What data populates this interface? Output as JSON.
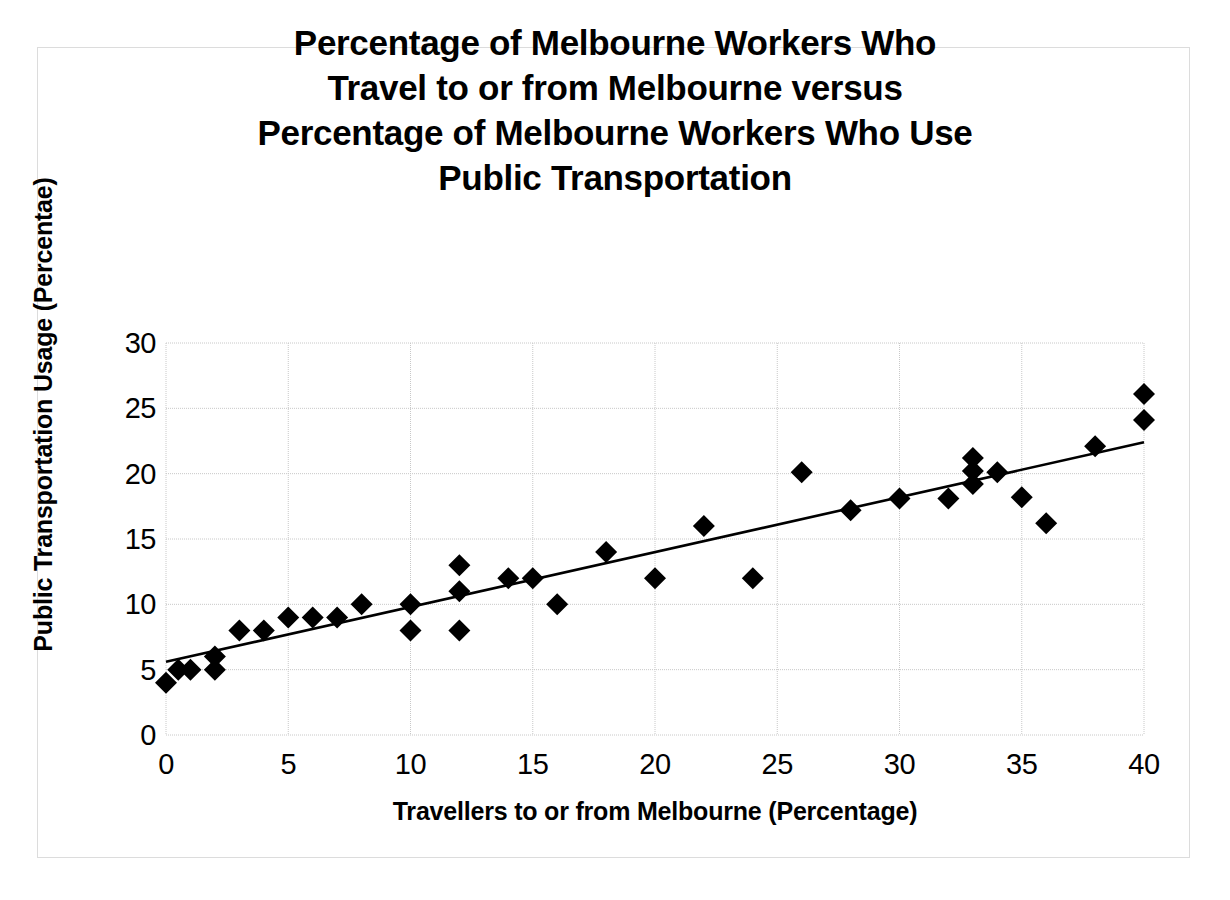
{
  "chart_data": {
    "type": "scatter",
    "title": "Percentage of Melbourne Workers Who\nTravel to or from Melbourne versus\nPercentage of Melbourne Workers Who Use\nPublic Transportation",
    "xlabel": "Travellers to or from Melbourne (Percentage)",
    "ylabel": "Public Transportation Usage (Percentae)",
    "xlim": [
      0,
      40
    ],
    "ylim": [
      0,
      30
    ],
    "xticks": [
      0,
      5,
      10,
      15,
      20,
      25,
      30,
      35,
      40
    ],
    "yticks": [
      0,
      5,
      10,
      15,
      20,
      25,
      30
    ],
    "grid": true,
    "legend": "none",
    "marker": "diamond",
    "marker_color": "#000000",
    "series": [
      {
        "name": "Melbourne workers",
        "points": [
          [
            0,
            4
          ],
          [
            0.5,
            5
          ],
          [
            1,
            5
          ],
          [
            2,
            6
          ],
          [
            2,
            5
          ],
          [
            3,
            8
          ],
          [
            4,
            8
          ],
          [
            5,
            9
          ],
          [
            6,
            9
          ],
          [
            7,
            9
          ],
          [
            8,
            10
          ],
          [
            10,
            10
          ],
          [
            10,
            8
          ],
          [
            12,
            13
          ],
          [
            12,
            11
          ],
          [
            12,
            8
          ],
          [
            14,
            12
          ],
          [
            15,
            12
          ],
          [
            16,
            10
          ],
          [
            18,
            14
          ],
          [
            20,
            12
          ],
          [
            22,
            16
          ],
          [
            24,
            12
          ],
          [
            26,
            20.1
          ],
          [
            28,
            17.2
          ],
          [
            30,
            18.1
          ],
          [
            32,
            18.1
          ],
          [
            33,
            21.2
          ],
          [
            33,
            20.2
          ],
          [
            33,
            19.2
          ],
          [
            34,
            20.1
          ],
          [
            35,
            18.2
          ],
          [
            36,
            16.2
          ],
          [
            38,
            22.1
          ],
          [
            40,
            26.1
          ],
          [
            40,
            24.1
          ]
        ]
      }
    ],
    "trendline": {
      "type": "linear",
      "color": "#000000",
      "x_start": 0,
      "y_start": 5.6,
      "x_end": 40,
      "y_end": 22.4
    }
  }
}
